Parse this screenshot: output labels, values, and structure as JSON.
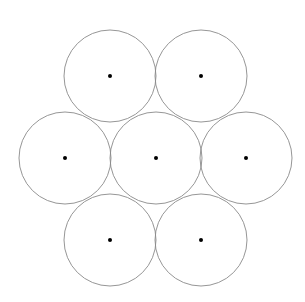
{
  "diagram": {
    "type": "hexagonal-circle-packing",
    "circle_count": 7,
    "stroke_color": "#8a8a8a",
    "dot_color": "#000000",
    "radius": 46,
    "dot_radius": 2,
    "circles": [
      {
        "id": "top-left",
        "cx": 110,
        "cy": 76
      },
      {
        "id": "top-right",
        "cx": 201,
        "cy": 76
      },
      {
        "id": "middle-left",
        "cx": 65,
        "cy": 158
      },
      {
        "id": "center",
        "cx": 156,
        "cy": 158
      },
      {
        "id": "middle-right",
        "cx": 246,
        "cy": 158
      },
      {
        "id": "bottom-left",
        "cx": 110,
        "cy": 240
      },
      {
        "id": "bottom-right",
        "cx": 201,
        "cy": 240
      }
    ]
  }
}
